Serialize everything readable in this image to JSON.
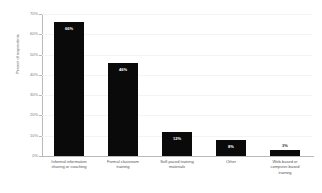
{
  "chart_data": {
    "type": "bar",
    "title": "",
    "xlabel": "",
    "ylabel": "Percent of respondents",
    "ylim": [
      0,
      70
    ],
    "grid": true,
    "legend": "none",
    "orientation": "vertical",
    "bar_color": "#0a0a0a",
    "categories": [
      "Informal information sharing or coaching",
      "Formal classroom training",
      "Self-paced training materials",
      "Other",
      "Web-based or computer-based training"
    ],
    "category_lines": [
      [
        "Informal information",
        "sharing or coaching"
      ],
      [
        "Formal classroom",
        "training"
      ],
      [
        "Self-paced training",
        "materials"
      ],
      [
        "Other"
      ],
      [
        "Web-based or",
        "computer-based",
        "training"
      ]
    ],
    "values": [
      66,
      46,
      12,
      8,
      3
    ],
    "data_labels": [
      "66%",
      "46%",
      "12%",
      "8%",
      "3%"
    ],
    "label_placement": [
      "inside",
      "inside",
      "inside",
      "inside",
      "outside"
    ],
    "yticks": [
      70,
      60,
      50,
      40,
      30,
      20,
      10,
      0
    ],
    "ytick_labels": [
      "70%",
      "60%",
      "50%",
      "40%",
      "30%",
      "20%",
      "10%",
      "0%"
    ]
  }
}
